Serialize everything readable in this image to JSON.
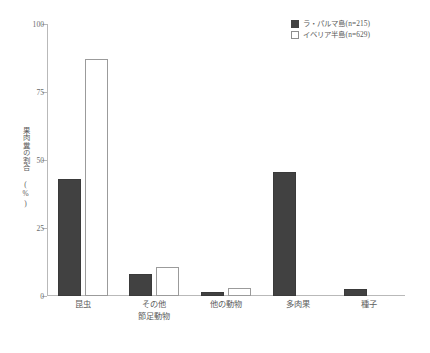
{
  "chart_data": {
    "type": "bar",
    "title": "",
    "subtitle": "",
    "xlabel": "",
    "ylabel": "果肉糞の割合 (%)",
    "ylabel_lines": [
      "果肉糞の割合",
      "(%)"
    ],
    "categories": [
      "昆虫",
      "その他節足動物",
      "他の動物",
      "多肉果",
      "種子"
    ],
    "category_lines": [
      [
        "昆虫"
      ],
      [
        "その他",
        "節足動物"
      ],
      [
        "他の動物"
      ],
      [
        "多肉果"
      ],
      [
        "種子"
      ]
    ],
    "series": [
      {
        "name": "ラ・パルマ島(n=215)",
        "values": [
          43,
          8,
          1.5,
          45.5,
          2.5
        ],
        "color": "#414141",
        "style": "filled"
      },
      {
        "name": "イベリア半島(n=629)",
        "values": [
          87,
          10.5,
          3,
          0,
          0
        ],
        "color": "#ffffff",
        "style": "hollow"
      }
    ],
    "ylim": [
      0,
      100
    ],
    "yticks": [
      0,
      25,
      50,
      75,
      100
    ],
    "ytick_labels": [
      "0",
      "25",
      "50",
      "75",
      "100"
    ],
    "grid": false,
    "legend_position": "top-right"
  },
  "legend": {
    "entries": [
      {
        "label": "ラ・パルマ島(n=215)"
      },
      {
        "label": "イベリア半島(n=629)"
      }
    ]
  },
  "axis": {
    "y_title": "果肉糞の割合 (%)",
    "y_title_line1": "果肉糞の割合",
    "y_title_line2": "(%)"
  }
}
